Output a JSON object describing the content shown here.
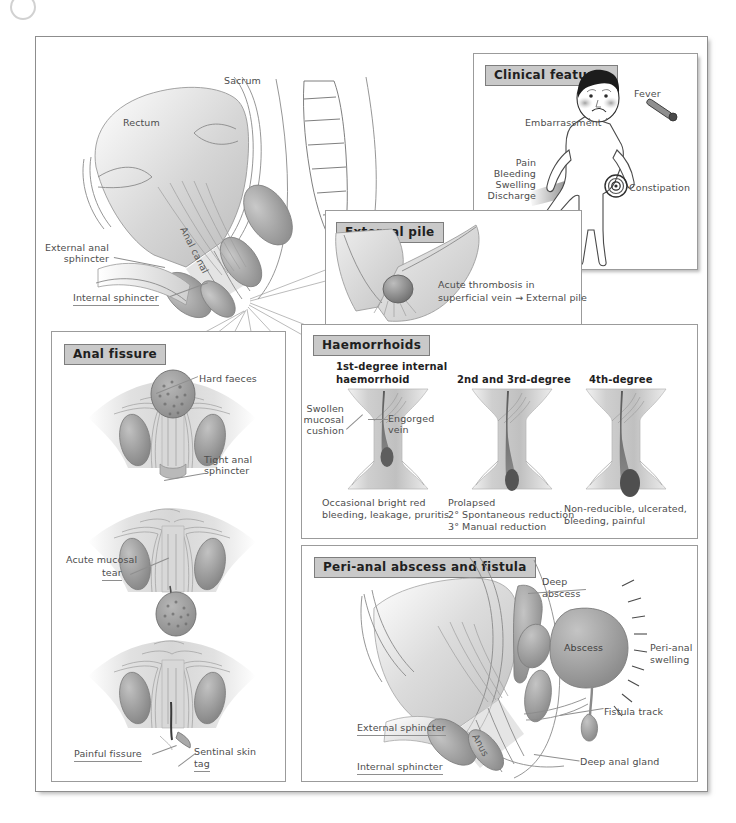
{
  "figure": {
    "title_hidden": "Anorectal conditions plate",
    "corner_icon": "circle-mark-icon"
  },
  "main_anatomy": {
    "labels": {
      "rectum": "Rectum",
      "sacrum": "Sacrum",
      "anal_canal": "Anal canal",
      "external_anal_sphincter": "External anal\nsphincter",
      "external_anal_sphincter_line1": "External anal",
      "external_anal_sphincter_line2": "sphincter",
      "internal_sphincter": "Internal sphincter"
    }
  },
  "clinical_features": {
    "title": "Clinical features",
    "labels": {
      "embarrassment": "Embarrassment",
      "fever": "Fever",
      "constipation": "Constipation",
      "pain": "Pain",
      "bleeding": "Bleeding",
      "swelling": "Swelling",
      "discharge": "Discharge"
    }
  },
  "external_pile": {
    "title": "External pile",
    "caption_line1": "Acute thrombosis in",
    "caption_line2": "superficial vein → External pile"
  },
  "haemorrhoids": {
    "title": "Haemorrhoids",
    "columns": [
      {
        "heading_line1": "1st-degree internal",
        "heading_line2": "haemorrhoid",
        "annotations": {
          "swollen_line1": "Swollen",
          "swollen_line2": "mucosal",
          "swollen_line3": "cushion",
          "engorged_line1": "Engorged",
          "engorged_line2": "vein"
        },
        "caption_line1": "Occasional bright red",
        "caption_line2": "bleeding, leakage, pruritis"
      },
      {
        "heading_line1": "2nd and 3rd-degree",
        "heading_line2": "",
        "caption_line1": "Prolapsed",
        "caption_line2": "2° Spontaneous reduction",
        "caption_line3": "3° Manual reduction"
      },
      {
        "heading_line1": "4th-degree",
        "heading_line2": "",
        "caption_line1": "Non-reducible, ulcerated,",
        "caption_line2": "bleeding, painful"
      }
    ]
  },
  "anal_fissure": {
    "title": "Anal fissure",
    "labels": {
      "hard_faeces": "Hard faeces",
      "tight_anal_line1": "Tight anal",
      "tight_anal_line2": "sphincter",
      "acute_mucosal_line1": "Acute mucosal",
      "acute_mucosal_line2": "tear",
      "painful_fissure": "Painful fissure",
      "sentinal_skin_line1": "Sentinal skin",
      "sentinal_skin_line2": "tag"
    }
  },
  "perianal_abscess": {
    "title": "Peri-anal abscess and fistula",
    "labels": {
      "deep_abscess_line1": "Deep",
      "deep_abscess_line2": "abscess",
      "abscess": "Abscess",
      "perianal_swelling_line1": "Peri-anal",
      "perianal_swelling_line2": "swelling",
      "fistula_track": "Fistula track",
      "deep_anal_gland": "Deep anal gland",
      "external_sphincter": "External sphincter",
      "internal_sphincter": "Internal sphincter",
      "anus": "Anus"
    }
  },
  "palette": {
    "ink": "#8a8a8a",
    "tissue_light": "#e3e3e3",
    "tissue_mid": "#c6c6c6",
    "tissue_dark": "#9a9a9a",
    "vein": "#6e6e6e",
    "header_bg": "#c9c9c9",
    "frame": "#8d8d8d"
  }
}
